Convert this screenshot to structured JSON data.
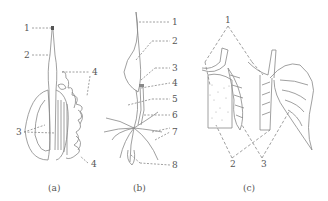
{
  "figure": {
    "panels": [
      {
        "id": "a",
        "caption": "(a)",
        "labels": [
          "1",
          "2",
          "3",
          "4",
          "4"
        ]
      },
      {
        "id": "b",
        "caption": "(b)",
        "labels": [
          "1",
          "2",
          "3",
          "4",
          "5",
          "6",
          "7",
          "8"
        ]
      },
      {
        "id": "c",
        "caption": "(c)",
        "labels": [
          "1",
          "2",
          "3"
        ]
      }
    ]
  },
  "colors": {
    "line": "#777777",
    "label": "#555555",
    "background": "#ffffff"
  }
}
